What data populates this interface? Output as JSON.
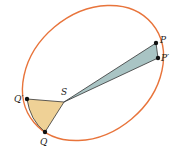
{
  "diagram": {
    "colors": {
      "orbit": "#e8743b",
      "sector_near": "#efd196",
      "sector_far": "#a9c4c4",
      "outline": "#333333",
      "point": "#111111"
    },
    "labels": {
      "sun": "S",
      "p": "P",
      "p_prime": "P′",
      "q": "Q",
      "q_prime": "Q′"
    }
  }
}
